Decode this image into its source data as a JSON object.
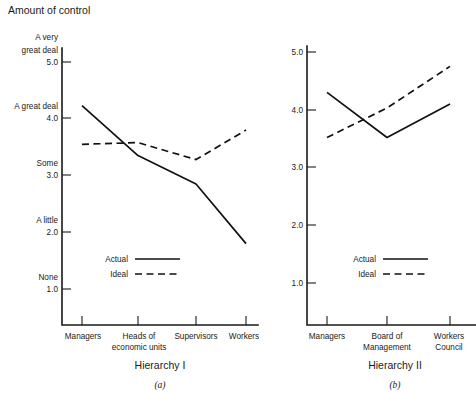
{
  "figure": {
    "axis_title": "Amount of control",
    "panels": [
      {
        "id": "a",
        "panel_label": "Hierarchy I",
        "panel_letter": "(a)",
        "legend": {
          "actual_label": "Actual",
          "ideal_label": "Ideal"
        }
      },
      {
        "id": "b",
        "panel_label": "Hierarchy II",
        "panel_letter": "(b)",
        "legend": {
          "actual_label": "Actual",
          "ideal_label": "Ideal"
        }
      }
    ]
  },
  "chart_data": [
    {
      "type": "line",
      "title": "Hierarchy I",
      "subtitle": "(a)",
      "xlabel": "Hierarchy I",
      "ylabel": "Amount of control",
      "ylim": [
        1.0,
        5.0
      ],
      "grid": false,
      "legend_position": "inside-lower-left",
      "categories": [
        "Managers",
        "Heads of economic units",
        "Supervisors",
        "Workers"
      ],
      "category_lines": [
        [
          "Managers"
        ],
        [
          "Heads of",
          "economic units"
        ],
        [
          "Supervisors"
        ],
        [
          "Workers"
        ]
      ],
      "yticks": [
        1.0,
        2.0,
        3.0,
        4.0,
        5.0
      ],
      "ytick_labels": [
        "1.0",
        "2.0",
        "3.0",
        "4.0",
        "5.0"
      ],
      "ytick_descriptors": [
        "None",
        "A little",
        "Some",
        "A great deal",
        "A very great deal"
      ],
      "ytick_descriptor_lines": [
        [
          "None"
        ],
        [
          "A little"
        ],
        [
          "Some"
        ],
        [
          "A great deal"
        ],
        [
          "A very",
          "great deal"
        ]
      ],
      "series": [
        {
          "name": "Actual",
          "style": "solid",
          "values": [
            4.23,
            3.35,
            2.85,
            1.8
          ]
        },
        {
          "name": "Ideal",
          "style": "dashed",
          "values": [
            3.55,
            3.58,
            3.28,
            3.8
          ]
        }
      ]
    },
    {
      "type": "line",
      "title": "Hierarchy II",
      "subtitle": "(b)",
      "xlabel": "Hierarchy II",
      "ylabel": "Amount of control",
      "ylim": [
        1.0,
        5.0
      ],
      "grid": false,
      "legend_position": "inside-lower-left",
      "categories": [
        "Managers",
        "Board of Management",
        "Workers Council"
      ],
      "category_lines": [
        [
          "Managers"
        ],
        [
          "Board of",
          "Management"
        ],
        [
          "Workers",
          "Council"
        ]
      ],
      "yticks": [
        1.0,
        2.0,
        3.0,
        4.0,
        5.0
      ],
      "ytick_labels": [
        "1.0",
        "2.0",
        "3.0",
        "4.0",
        "5.0"
      ],
      "series": [
        {
          "name": "Actual",
          "style": "solid",
          "values": [
            4.3,
            3.52,
            4.1
          ]
        },
        {
          "name": "Ideal",
          "style": "dashed",
          "values": [
            3.52,
            4.03,
            4.75
          ]
        }
      ]
    }
  ],
  "labels": {
    "left": {
      "y_5": "5.0",
      "y_4": "4.0",
      "y_3": "3.0",
      "y_2": "2.0",
      "y_1": "1.0",
      "d_5_l1": "A very",
      "d_5_l2": "great deal",
      "d_4": "A great deal",
      "d_3": "Some",
      "d_2": "A little",
      "d_1": "None",
      "x_1": "Managers",
      "x_2_l1": "Heads of",
      "x_2_l2": "economic units",
      "x_3": "Supervisors",
      "x_4": "Workers"
    },
    "right": {
      "y_5": "5.0",
      "y_4": "4.0",
      "y_3": "3.0",
      "y_2": "2.0",
      "y_1": "1.0",
      "x_1": "Managers",
      "x_2_l1": "Board of",
      "x_2_l2": "Management",
      "x_3_l1": "Workers",
      "x_3_l2": "Council"
    }
  },
  "colors": {
    "ink": "#1a1a1a",
    "line": "#111111",
    "background": "#ffffff"
  }
}
